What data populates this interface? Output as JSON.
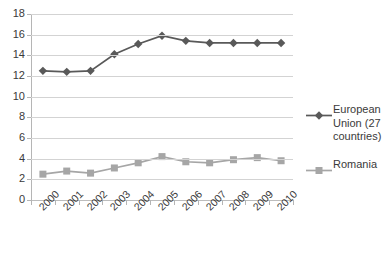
{
  "chart_data": {
    "type": "line",
    "title": "",
    "xlabel": "",
    "ylabel": "",
    "categories": [
      "2000",
      "2001",
      "2002",
      "2003",
      "2004",
      "2005",
      "2006",
      "2007",
      "2008",
      "2009",
      "2010"
    ],
    "ylim": [
      0,
      18
    ],
    "y_ticks": [
      0,
      2,
      4,
      6,
      8,
      10,
      12,
      14,
      16,
      18
    ],
    "grid": true,
    "legend_position": "right",
    "series": [
      {
        "name": "European Union (27 countries)",
        "color": "#595959",
        "marker": "diamond",
        "values": [
          12.5,
          12.4,
          12.5,
          14.1,
          15.1,
          15.9,
          15.4,
          15.2,
          15.2,
          15.2,
          15.2
        ]
      },
      {
        "name": "Romania",
        "color": "#a6a6a6",
        "marker": "square",
        "values": [
          2.5,
          2.8,
          2.6,
          3.1,
          3.6,
          4.2,
          3.7,
          3.6,
          3.9,
          4.1,
          3.8
        ]
      }
    ]
  },
  "legend": {
    "entries": [
      {
        "label": "European Union (27 countries)"
      },
      {
        "label": "Romania"
      }
    ]
  }
}
